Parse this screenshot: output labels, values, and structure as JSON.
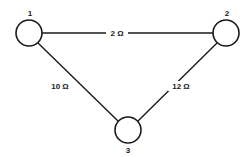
{
  "diagram": {
    "type": "resistor-network-graph",
    "nodes": [
      {
        "id": "1",
        "label": "1",
        "cx": 29,
        "cy": 33,
        "r": 13,
        "lx": 30,
        "ly": 16
      },
      {
        "id": "2",
        "label": "2",
        "cx": 226,
        "cy": 33,
        "r": 13,
        "lx": 227,
        "ly": 16
      },
      {
        "id": "3",
        "label": "3",
        "cx": 128,
        "cy": 130,
        "r": 13,
        "lx": 128,
        "ly": 153
      }
    ],
    "edges": [
      {
        "id": "e12",
        "from": "1",
        "to": "2",
        "label": "2 Ω",
        "resistance_ohms": 2,
        "lx": 117,
        "ly": 36
      },
      {
        "id": "e13",
        "from": "1",
        "to": "3",
        "label": "10 Ω",
        "resistance_ohms": 10,
        "lx": 60,
        "ly": 89
      },
      {
        "id": "e23",
        "from": "2",
        "to": "3",
        "label": "12 Ω",
        "resistance_ohms": 12,
        "lx": 181,
        "ly": 89
      }
    ],
    "colors": {
      "stroke": "#1a1a1a",
      "background": "#ffffff"
    }
  }
}
